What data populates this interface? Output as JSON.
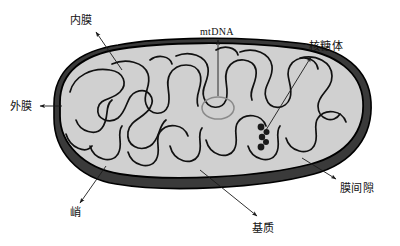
{
  "figure": {
    "type": "biological-diagram",
    "background_color": "#ffffff"
  },
  "colors": {
    "outer_membrane_fill": "#3a3a3a",
    "inner_matrix_fill": "#d0d0d0",
    "cristae_stroke": "#111111",
    "outline_stroke": "#000000",
    "ribosome_fill": "#1b1b1b",
    "mtdna_stroke": "#8a8a8a",
    "label_color": "#111111",
    "leader_line_color": "#1a1a1a"
  },
  "labels": [
    {
      "id": "inner-membrane",
      "text": "内膜",
      "x": 70,
      "y": 24,
      "anchor": "start",
      "script": "cjk",
      "leader": {
        "x1": 95,
        "y1": 30,
        "x2": 120,
        "y2": 68,
        "arrow_at": "start"
      }
    },
    {
      "id": "mtdna",
      "text": "mtDNA",
      "x": 200,
      "y": 35,
      "anchor": "start",
      "script": "latin",
      "leader": {
        "x1": 218,
        "y1": 40,
        "x2": 218,
        "y2": 96,
        "arrow_at": "start"
      }
    },
    {
      "id": "ribosome",
      "text": "核糖体",
      "x": 309,
      "y": 50,
      "anchor": "start",
      "script": "cjk",
      "leader": {
        "x1": 312,
        "y1": 56,
        "x2": 268,
        "y2": 128,
        "arrow_at": "start"
      }
    },
    {
      "id": "outer-membrane",
      "text": "外膜",
      "x": 10,
      "y": 110,
      "anchor": "start",
      "script": "cjk",
      "leader": {
        "x1": 40,
        "y1": 106,
        "x2": 62,
        "y2": 106,
        "arrow_at": "end"
      }
    },
    {
      "id": "intermembrane-space",
      "text": "膜间隙",
      "x": 340,
      "y": 190,
      "anchor": "start",
      "script": "cjk",
      "leader": {
        "x1": 335,
        "y1": 178,
        "x2": 300,
        "y2": 158,
        "arrow_at": "start"
      }
    },
    {
      "id": "crista",
      "text": "峭",
      "x": 70,
      "y": 215,
      "anchor": "start",
      "script": "cjk",
      "leader": {
        "x1": 80,
        "y1": 205,
        "x2": 105,
        "y2": 168,
        "arrow_at": "start"
      }
    },
    {
      "id": "matrix",
      "text": "基质",
      "x": 263,
      "y": 230,
      "anchor": "middle",
      "script": "cjk",
      "leader": {
        "x1": 258,
        "y1": 218,
        "x2": 200,
        "y2": 170,
        "arrow_at": "start"
      }
    }
  ],
  "structures": {
    "outer_membrane": {
      "name": "外膜",
      "description": "dark outer boundary band"
    },
    "inner_membrane": {
      "name": "内膜",
      "description": "inner folded boundary"
    },
    "cristae": {
      "name": "峭",
      "description": "infolded finger-like cristae"
    },
    "matrix": {
      "name": "基质",
      "description": "light grey interior space"
    },
    "intermembrane_space": {
      "name": "膜间隙",
      "description": "gap between membranes"
    },
    "mtdna": {
      "name": "mtDNA",
      "description": "circular grey ring",
      "cx": 218,
      "cy": 108,
      "rx": 16,
      "ry": 11
    },
    "ribosomes": {
      "name": "核糖体",
      "description": "chain of dark dots",
      "dots": [
        {
          "cx": 261,
          "cy": 127,
          "r": 3.4
        },
        {
          "cx": 266,
          "cy": 132,
          "r": 3.0
        },
        {
          "cx": 262,
          "cy": 137,
          "r": 3.2
        },
        {
          "cx": 265,
          "cy": 142,
          "r": 3.0
        },
        {
          "cx": 261,
          "cy": 147,
          "r": 3.4
        }
      ]
    }
  }
}
